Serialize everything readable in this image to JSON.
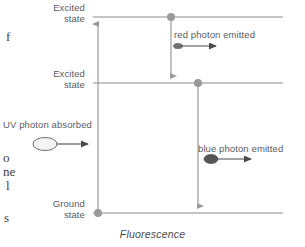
{
  "figure": {
    "caption": "Fluorescence",
    "levels": [
      {
        "id": "excited-top",
        "label_line1": "Excited",
        "label_line2": "state",
        "y": 17
      },
      {
        "id": "excited-mid",
        "label_line1": "Excited",
        "label_line2": "state",
        "y": 83
      },
      {
        "id": "ground",
        "label_line1": "Ground",
        "label_line2": "state",
        "y": 213
      }
    ],
    "annotations": {
      "uv_absorbed": "UV photon absorbed",
      "red_emitted": "red photon emitted",
      "blue_emitted": "blue photon emitted"
    },
    "transitions": [
      {
        "id": "uv-absorption",
        "from": "ground",
        "to": "excited-top",
        "direction": "up",
        "x": 98
      },
      {
        "id": "red-relaxation",
        "from": "excited-top",
        "to": "excited-mid",
        "direction": "down",
        "x": 171
      },
      {
        "id": "blue-emission",
        "from": "excited-mid",
        "to": "ground",
        "direction": "down",
        "x": 198
      }
    ],
    "electrons": [
      {
        "id": "electron-top",
        "x": 171,
        "y": 17,
        "fill": "#9a9a9a"
      },
      {
        "id": "electron-mid",
        "x": 198,
        "y": 83,
        "fill": "#9a9a9a"
      },
      {
        "id": "electron-ground",
        "x": 98,
        "y": 213,
        "fill": "#9a9a9a"
      }
    ],
    "photons": [
      {
        "id": "uv-photon",
        "style": "open",
        "fill": "#f2f2f2",
        "stroke": "#6b6b6b"
      },
      {
        "id": "blue-photon",
        "style": "filled",
        "fill": "#555555",
        "stroke": "#555555"
      }
    ],
    "colors": {
      "level_line": "#8c8c8c",
      "transition_line": "#9a9a9a",
      "photon_arrow": "#4a4a4a",
      "text": "#5b5b5b",
      "background": "#ffffff"
    }
  },
  "margin_text": {
    "frag_1": "f",
    "frag_2": "o",
    "frag_3": "ne",
    "frag_4": "l",
    "frag_5": "s"
  }
}
